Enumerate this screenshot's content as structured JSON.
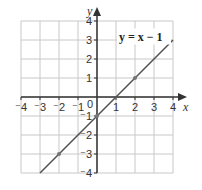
{
  "chart_data": {
    "type": "line",
    "title": "",
    "xlabel": "x",
    "ylabel": "y",
    "xlim": [
      -4,
      4
    ],
    "ylim": [
      -4,
      4
    ],
    "grid": true,
    "x_ticks": [
      "-4",
      "-3",
      "-2",
      "-1",
      "1",
      "2",
      "3",
      "4"
    ],
    "y_ticks": [
      "4",
      "3",
      "2",
      "1",
      "-1",
      "-2",
      "-3",
      "-4"
    ],
    "origin_label": "0",
    "annotation": "y = x − 1",
    "series": [
      {
        "name": "y = x − 1",
        "x": [
          -3,
          4
        ],
        "y": [
          -4,
          3
        ],
        "marked_points": [
          [
            -2,
            -3
          ],
          [
            0,
            -1
          ],
          [
            2,
            1
          ]
        ]
      }
    ]
  },
  "colors": {
    "grid": "#c8c8c8",
    "axis": "#333333",
    "line": "#555555",
    "point": "#777777"
  }
}
